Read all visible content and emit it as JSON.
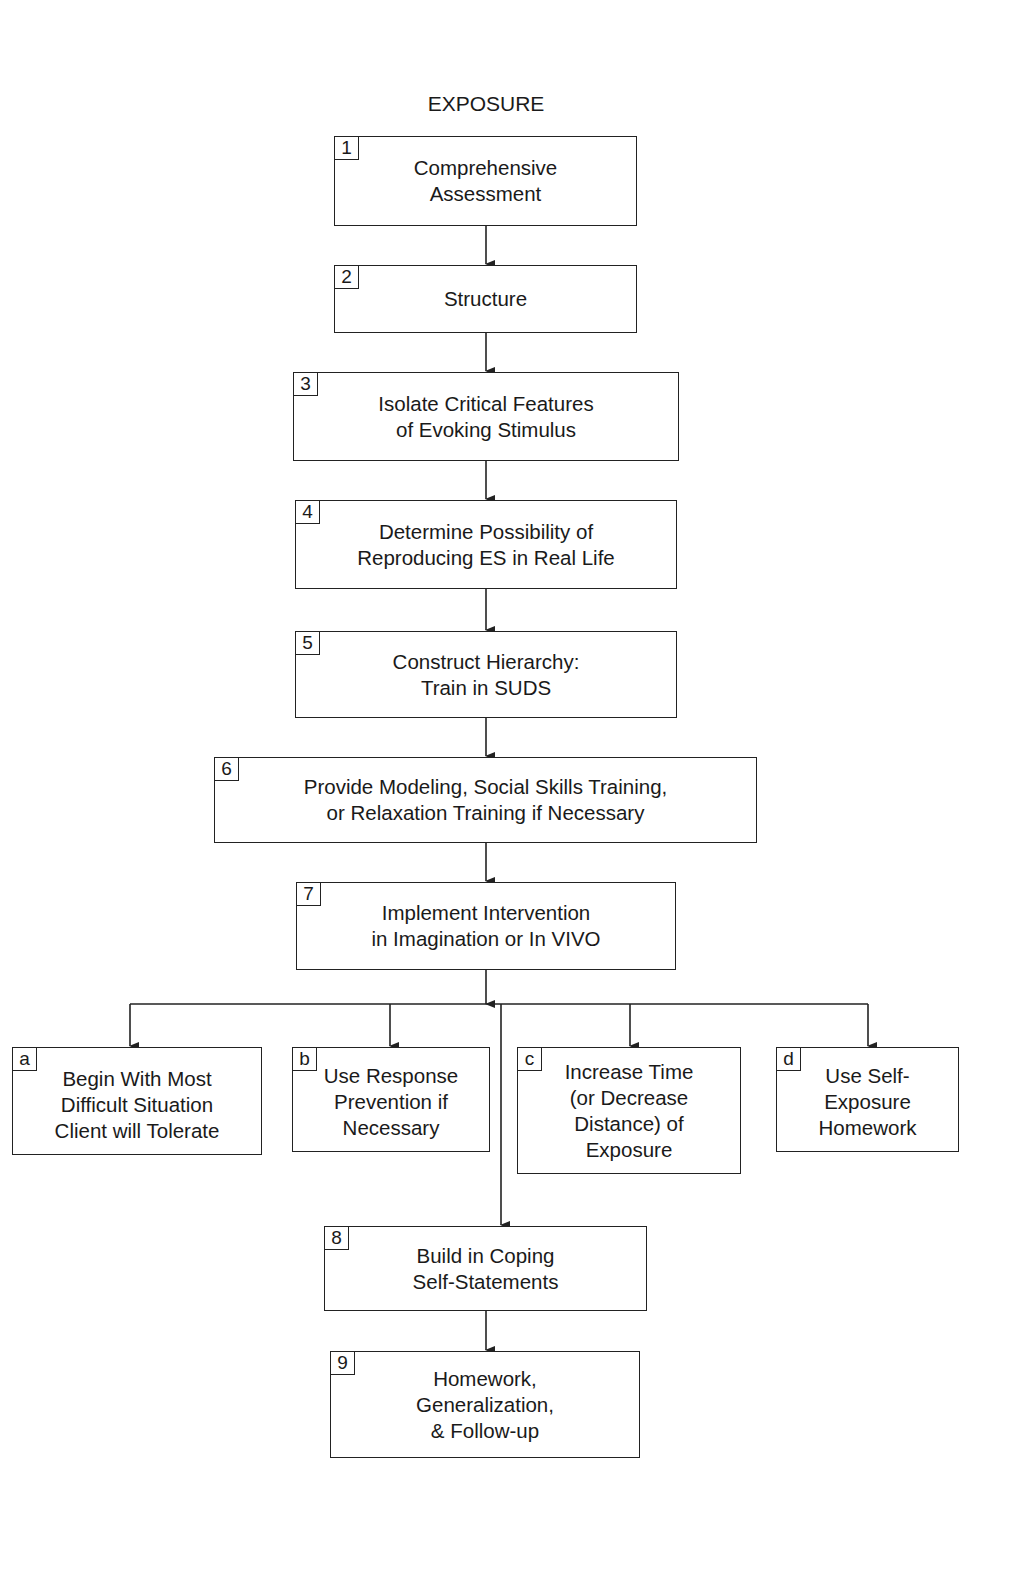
{
  "title": "EXPOSURE",
  "steps": [
    {
      "num": "1",
      "text": "Comprehensive\nAssessment"
    },
    {
      "num": "2",
      "text": "Structure"
    },
    {
      "num": "3",
      "text": "Isolate Critical Features\nof Evoking Stimulus"
    },
    {
      "num": "4",
      "text": "Determine Possibility of\nReproducing ES in Real Life"
    },
    {
      "num": "5",
      "text": "Construct Hierarchy:\nTrain in SUDS"
    },
    {
      "num": "6",
      "text": "Provide Modeling, Social Skills Training,\nor Relaxation Training if Necessary"
    },
    {
      "num": "7",
      "text": "Implement Intervention\nin Imagination or In VIVO"
    },
    {
      "num": "8",
      "text": "Build in Coping\nSelf-Statements"
    },
    {
      "num": "9",
      "text": "Homework,\nGeneralization,\n& Follow-up"
    }
  ],
  "branches": [
    {
      "num": "a",
      "text": "Begin With Most\nDifficult Situation\nClient will Tolerate"
    },
    {
      "num": "b",
      "text": "Use Response\nPrevention if\nNecessary"
    },
    {
      "num": "c",
      "text": "Increase Time\n(or Decrease\nDistance) of\nExposure"
    },
    {
      "num": "d",
      "text": "Use Self-\nExposure\nHomework"
    }
  ]
}
